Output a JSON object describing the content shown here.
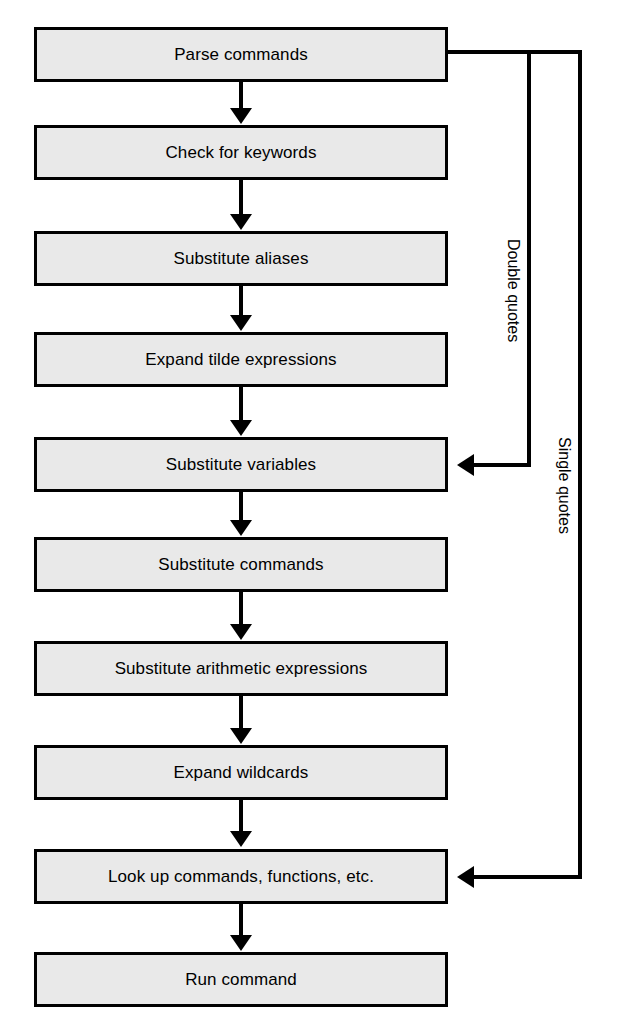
{
  "diagram": {
    "type": "flowchart",
    "orientation": "top-to-bottom",
    "background_color": "#ffffff",
    "node_fill_color": "#e9e9e9",
    "node_border_color": "#000000",
    "text_color": "#000000",
    "nodes": [
      {
        "id": "parse-commands",
        "label": "Parse commands"
      },
      {
        "id": "check-for-keywords",
        "label": "Check for keywords"
      },
      {
        "id": "substitute-aliases",
        "label": "Substitute aliases"
      },
      {
        "id": "expand-tilde",
        "label": "Expand tilde expressions"
      },
      {
        "id": "substitute-variables",
        "label": "Substitute variables"
      },
      {
        "id": "substitute-commands",
        "label": "Substitute commands"
      },
      {
        "id": "substitute-arithmetic",
        "label": "Substitute arithmetic expressions"
      },
      {
        "id": "expand-wildcards",
        "label": "Expand wildcards"
      },
      {
        "id": "look-up-commands",
        "label": "Look up commands, functions, etc."
      },
      {
        "id": "run-command",
        "label": "Run command"
      }
    ],
    "edge_labels": {
      "double_quotes": "Double quotes",
      "single_quotes": "Single quotes"
    },
    "bypass_edges": [
      {
        "id": "double-quotes-bypass",
        "label": "Double quotes",
        "from": "parse-commands",
        "to": "substitute-variables"
      },
      {
        "id": "single-quotes-bypass",
        "label": "Single quotes",
        "from": "parse-commands",
        "to": "look-up-commands"
      }
    ]
  }
}
